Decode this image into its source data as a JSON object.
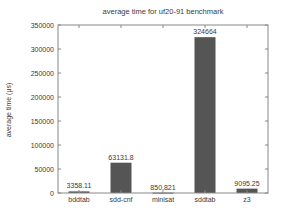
{
  "chart_data": {
    "type": "bar",
    "title": "average time for uf20-91 benchmark",
    "xlabel": "",
    "ylabel": "average time (μs)",
    "categories": [
      "bddtab",
      "sdd-cnf",
      "minisat",
      "sddtab",
      "z3"
    ],
    "values": [
      3358.11,
      63131.8,
      850.821,
      324664,
      9095.25
    ],
    "value_labels": [
      "3358.11",
      "63131.8",
      "850.821",
      "324664",
      "9095.25"
    ],
    "ylim": [
      0,
      350000
    ],
    "yticks": [
      0,
      50000,
      100000,
      150000,
      200000,
      250000,
      300000,
      350000
    ],
    "ytick_labels": [
      "0",
      "50000",
      "100000",
      "150000",
      "200000",
      "250000",
      "300000",
      "350000"
    ],
    "grid": false,
    "legend": null,
    "colors": {
      "bar": "#555555",
      "frame": "#888888",
      "text": "#3a3a3a"
    }
  }
}
